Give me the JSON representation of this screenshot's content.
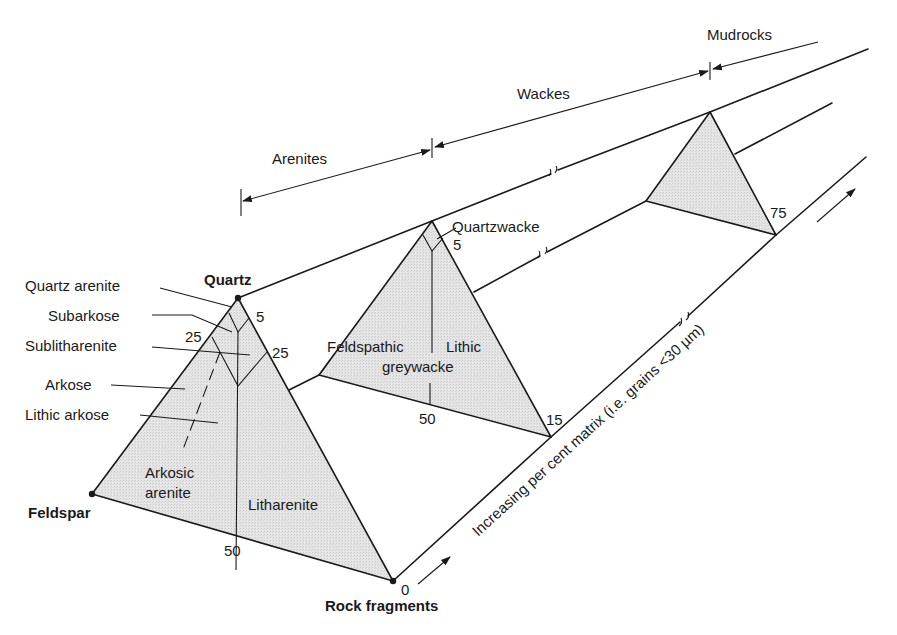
{
  "diagram": {
    "type": "sandstone-classification-prisms",
    "colors": {
      "line": "#1a1a1a",
      "fill": "#e3e3e3",
      "background": "#ffffff"
    },
    "categories": {
      "arenites": "Arenites",
      "wackes": "Wackes",
      "mudrocks": "Mudrocks"
    },
    "vertices": {
      "quartz": "Quartz",
      "feldspar": "Feldspar",
      "rock_fragments": "Rock fragments"
    },
    "arenite_triangle": {
      "fields": {
        "quartz_arenite": "Quartz arenite",
        "subarkose": "Subarkose",
        "sublitharenite": "Sublitharenite",
        "arkose": "Arkose",
        "lithic_arkose": "Lithic arkose",
        "arkosic_line1": "Arkosic",
        "arkosic_line2": "arenite",
        "litharenite": "Litharenite"
      },
      "ticks": {
        "q5": "5",
        "q25_left": "25",
        "q25_right": "25",
        "base50": "50"
      }
    },
    "wacke_triangle": {
      "fields": {
        "quartzwacke": "Quartzwacke",
        "feldspathic": "Feldspathic",
        "lithic": "Lithic",
        "greywacke": "greywacke"
      },
      "ticks": {
        "q5": "5",
        "base50": "50"
      }
    },
    "matrix_axis": {
      "label": "Increasing per cent matrix (i.e. grains <30 µm)",
      "ticks": [
        "0",
        "15",
        "75"
      ]
    }
  }
}
